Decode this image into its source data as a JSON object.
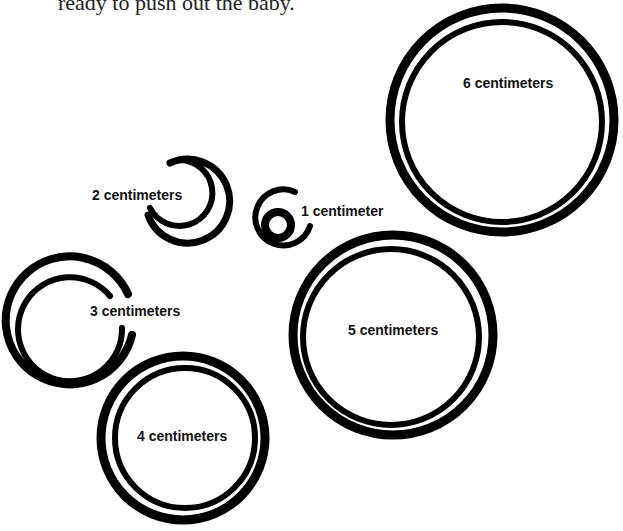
{
  "caption": "ready to push out the baby.",
  "diagram": {
    "circles": [
      {
        "label": "1 centimeter",
        "size_cm": 1
      },
      {
        "label": "2 centimeters",
        "size_cm": 2
      },
      {
        "label": "3 centimeters",
        "size_cm": 3
      },
      {
        "label": "4 centimeters",
        "size_cm": 4
      },
      {
        "label": "5 centimeters",
        "size_cm": 5
      },
      {
        "label": "6 centimeters",
        "size_cm": 6
      }
    ],
    "stroke_color": "#000000",
    "background": "#ffffff"
  }
}
